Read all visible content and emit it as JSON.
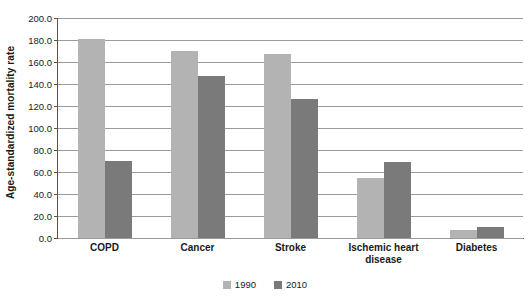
{
  "chart_data": {
    "type": "bar",
    "title": "",
    "xlabel": "",
    "ylabel": "Age-standardized mortality rate",
    "ylim": [
      0,
      200
    ],
    "ytick_step": 20,
    "ytick_labels": [
      "200.0",
      "180.0",
      "160.0",
      "140.0",
      "120.0",
      "100.0",
      "80.0",
      "60.0",
      "40.0",
      "20.0",
      "0.0"
    ],
    "ytick_values": [
      200,
      180,
      160,
      140,
      120,
      100,
      80,
      60,
      40,
      20,
      0
    ],
    "categories": [
      "COPD",
      "Cancer",
      "Stroke",
      "Ischemic heart disease",
      "Diabetes"
    ],
    "category_lines": [
      [
        "COPD"
      ],
      [
        "Cancer"
      ],
      [
        "Stroke"
      ],
      [
        "Ischemic heart",
        "disease"
      ],
      [
        "Diabetes"
      ]
    ],
    "series": [
      {
        "name": "1990",
        "color": "#b3b3b3",
        "values": [
          181,
          170,
          167,
          55,
          7
        ]
      },
      {
        "name": "2010",
        "color": "#7a7a7a",
        "values": [
          70,
          147,
          126,
          69,
          10
        ]
      }
    ],
    "grid": true,
    "legend_position": "bottom",
    "legend": [
      {
        "label": "1990",
        "color": "#b3b3b3"
      },
      {
        "label": "2010",
        "color": "#7a7a7a"
      }
    ]
  }
}
